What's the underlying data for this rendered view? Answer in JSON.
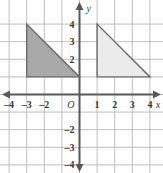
{
  "figure": {
    "type": "coordinate-plane",
    "background": "#ffffff",
    "grid_color": "#bfbfbf",
    "axis_color": "#595959",
    "tick_label_color": "#3a3a3a"
  },
  "axes": {
    "x_axis_label": "x",
    "y_axis_label": "y",
    "origin_label": "O",
    "x_min": -4.5,
    "x_max": 4.5,
    "y_min": -4.5,
    "y_max": 4.5,
    "x_tick_labels": [
      "-4",
      "-3",
      "-2",
      "1",
      "2",
      "3",
      "4"
    ],
    "x_tick_values": [
      -4,
      -3,
      -2,
      1,
      2,
      3,
      4
    ],
    "y_tick_labels": [
      "4",
      "3",
      "2",
      "-2",
      "-3",
      "-4"
    ],
    "y_tick_values": [
      4,
      3,
      2,
      -2,
      -3,
      -4
    ],
    "grid_step": 1,
    "arrowheads": [
      "left",
      "right",
      "up",
      "down"
    ]
  },
  "chart_data": {
    "type": "scatter",
    "title": "",
    "xlabel": "x",
    "ylabel": "y",
    "xlim": [
      -4.5,
      4.5
    ],
    "ylim": [
      -4.5,
      4.5
    ],
    "grid": true,
    "shapes": [
      {
        "name": "left-triangle",
        "kind": "right-triangle",
        "vertices": [
          [
            -3,
            4
          ],
          [
            -3,
            1
          ],
          [
            0,
            1
          ]
        ],
        "fill": "#a9a9a9",
        "stroke": "#6b6b6b",
        "leg_horizontal": 3,
        "leg_vertical": 3
      },
      {
        "name": "right-triangle",
        "kind": "right-triangle",
        "vertices": [
          [
            1,
            4
          ],
          [
            1,
            1
          ],
          [
            4,
            1
          ]
        ],
        "fill": "#ebebeb",
        "stroke": "#6b6b6b",
        "leg_horizontal": 3,
        "leg_vertical": 3
      }
    ]
  }
}
